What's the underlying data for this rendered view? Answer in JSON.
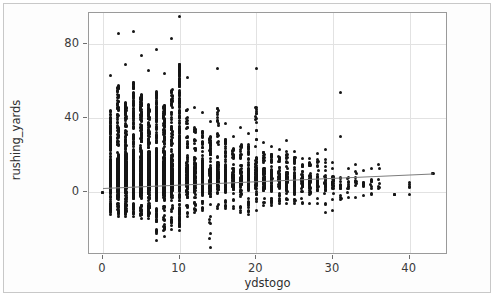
{
  "figure": {
    "background_color": "#ffffff",
    "frame_border_color": "#c8c8c8",
    "plot_border_color": "#9a9a9a",
    "gridline_color": "#e2e2e2",
    "point_color": "#151515",
    "trend_color": "#7d7d7d"
  },
  "chart_data": {
    "type": "scatter",
    "title": "",
    "xlabel": "ydstogo",
    "ylabel": "rushing_yards",
    "xlim": [
      -1.8,
      45.0
    ],
    "ylim": [
      -34.0,
      97.0
    ],
    "xticks": [
      0,
      10,
      20,
      30,
      40
    ],
    "xticklabels": [
      "0",
      "10",
      "20",
      "30",
      "40"
    ],
    "yticks": [
      0,
      40,
      80
    ],
    "yticklabels": [
      "0",
      "40",
      "80"
    ],
    "grid": true,
    "legend": "none",
    "marker": "circle",
    "marker_size": 3,
    "series": [
      {
        "name": "rushing_yards vs ydstogo",
        "description": "Play-level NFL rushing yards by yards-to-go; x is integer valued so points form dense vertical columns. Density is heaviest at ydstogo=10 (standard 1st-and-10), tapering sharply beyond 20.",
        "columns": [
          {
            "x": 0,
            "count": 1,
            "ymin": 0,
            "ymax": 0,
            "ylow_common": 0,
            "yhigh_common": 0
          },
          {
            "x": 1,
            "count": 420,
            "ymin": -12,
            "ymax": 63,
            "ylow_common": -6,
            "yhigh_common": 22
          },
          {
            "x": 2,
            "count": 470,
            "ymin": -13,
            "ymax": 86,
            "ylow_common": -6,
            "yhigh_common": 24
          },
          {
            "x": 3,
            "count": 470,
            "ymin": -13,
            "ymax": 69,
            "ylow_common": -6,
            "yhigh_common": 25
          },
          {
            "x": 4,
            "count": 470,
            "ymin": -13,
            "ymax": 87,
            "ylow_common": -6,
            "yhigh_common": 26
          },
          {
            "x": 5,
            "count": 470,
            "ymin": -14,
            "ymax": 74,
            "ylow_common": -7,
            "yhigh_common": 27
          },
          {
            "x": 6,
            "count": 460,
            "ymin": -14,
            "ymax": 66,
            "ylow_common": -7,
            "yhigh_common": 26
          },
          {
            "x": 7,
            "count": 450,
            "ymin": -26,
            "ymax": 77,
            "ylow_common": -7,
            "yhigh_common": 27
          },
          {
            "x": 8,
            "count": 440,
            "ymin": -24,
            "ymax": 64,
            "ylow_common": -7,
            "yhigh_common": 26
          },
          {
            "x": 9,
            "count": 300,
            "ymin": -20,
            "ymax": 83,
            "ylow_common": -7,
            "yhigh_common": 25
          },
          {
            "x": 10,
            "count": 1600,
            "ymin": -21,
            "ymax": 95,
            "ylow_common": -8,
            "yhigh_common": 40
          },
          {
            "x": 11,
            "count": 150,
            "ymin": -13,
            "ymax": 62,
            "ylow_common": -6,
            "yhigh_common": 24
          },
          {
            "x": 12,
            "count": 140,
            "ymin": -11,
            "ymax": 46,
            "ylow_common": -5,
            "yhigh_common": 22
          },
          {
            "x": 13,
            "count": 130,
            "ymin": -10,
            "ymax": 43,
            "ylow_common": -5,
            "yhigh_common": 21
          },
          {
            "x": 14,
            "count": 120,
            "ymin": -30,
            "ymax": 38,
            "ylow_common": -5,
            "yhigh_common": 20
          },
          {
            "x": 15,
            "count": 130,
            "ymin": -9,
            "ymax": 67,
            "ylow_common": -5,
            "yhigh_common": 23
          },
          {
            "x": 16,
            "count": 110,
            "ymin": -9,
            "ymax": 37,
            "ylow_common": -4,
            "yhigh_common": 19
          },
          {
            "x": 17,
            "count": 100,
            "ymin": -9,
            "ymax": 30,
            "ylow_common": -4,
            "yhigh_common": 18
          },
          {
            "x": 18,
            "count": 95,
            "ymin": -11,
            "ymax": 35,
            "ylow_common": -4,
            "yhigh_common": 18
          },
          {
            "x": 19,
            "count": 95,
            "ymin": -12,
            "ymax": 32,
            "ylow_common": -4,
            "yhigh_common": 19
          },
          {
            "x": 20,
            "count": 100,
            "ymin": -10,
            "ymax": 67,
            "ylow_common": -4,
            "yhigh_common": 22
          },
          {
            "x": 21,
            "count": 80,
            "ymin": -7,
            "ymax": 27,
            "ylow_common": -3,
            "yhigh_common": 17
          },
          {
            "x": 22,
            "count": 75,
            "ymin": -7,
            "ymax": 25,
            "ylow_common": -3,
            "yhigh_common": 16
          },
          {
            "x": 23,
            "count": 70,
            "ymin": -6,
            "ymax": 23,
            "ylow_common": -3,
            "yhigh_common": 16
          },
          {
            "x": 24,
            "count": 65,
            "ymin": -6,
            "ymax": 28,
            "ylow_common": -3,
            "yhigh_common": 16
          },
          {
            "x": 25,
            "count": 60,
            "ymin": -6,
            "ymax": 22,
            "ylow_common": -3,
            "yhigh_common": 15
          },
          {
            "x": 26,
            "count": 50,
            "ymin": -6,
            "ymax": 18,
            "ylow_common": -3,
            "yhigh_common": 14
          },
          {
            "x": 27,
            "count": 45,
            "ymin": -6,
            "ymax": 18,
            "ylow_common": -3,
            "yhigh_common": 14
          },
          {
            "x": 28,
            "count": 40,
            "ymin": -6,
            "ymax": 21,
            "ylow_common": -3,
            "yhigh_common": 14
          },
          {
            "x": 29,
            "count": 30,
            "ymin": -11,
            "ymax": 23,
            "ylow_common": -4,
            "yhigh_common": 14
          },
          {
            "x": 30,
            "count": 26,
            "ymin": -10,
            "ymax": 16,
            "ylow_common": -3,
            "yhigh_common": 12
          },
          {
            "x": 31,
            "count": 14,
            "ymin": -4,
            "ymax": 54,
            "ylow_common": -1,
            "yhigh_common": 10
          },
          {
            "x": 32,
            "count": 10,
            "ymin": -3,
            "ymax": 13,
            "ylow_common": 0,
            "yhigh_common": 9
          },
          {
            "x": 33,
            "count": 9,
            "ymin": -3,
            "ymax": 15,
            "ylow_common": 0,
            "yhigh_common": 10
          },
          {
            "x": 34,
            "count": 7,
            "ymin": -2,
            "ymax": 12,
            "ylow_common": 0,
            "yhigh_common": 8
          },
          {
            "x": 35,
            "count": 8,
            "ymin": -1,
            "ymax": 13,
            "ylow_common": 1,
            "yhigh_common": 10
          },
          {
            "x": 36,
            "count": 5,
            "ymin": 2,
            "ymax": 15,
            "ylow_common": 3,
            "yhigh_common": 11
          },
          {
            "x": 38,
            "count": 1,
            "ymin": -1,
            "ymax": -1,
            "ylow_common": -1,
            "yhigh_common": -1
          },
          {
            "x": 40,
            "count": 3,
            "ymin": -1,
            "ymax": 5,
            "ylow_common": -1,
            "yhigh_common": 5
          },
          {
            "x": 43,
            "count": 1,
            "ymin": 10,
            "ymax": 10,
            "ylow_common": 10,
            "yhigh_common": 10
          }
        ]
      }
    ],
    "trendline": {
      "name": "linear-fit",
      "type": "line",
      "color": "#7d7d7d",
      "x_start": 0,
      "y_start": 2.2,
      "x_end": 43,
      "y_end": 10.0,
      "slope": 0.181,
      "intercept": 2.2
    }
  }
}
